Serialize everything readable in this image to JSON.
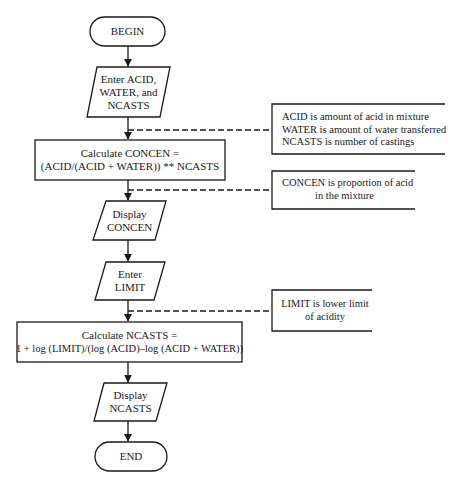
{
  "flowchart": {
    "nodes": [
      {
        "id": "begin",
        "type": "terminal",
        "lines": [
          "BEGIN"
        ]
      },
      {
        "id": "input1",
        "type": "io",
        "lines": [
          "Enter ACID,",
          "WATER, and",
          "NCASTS"
        ]
      },
      {
        "id": "calc1",
        "type": "process",
        "lines": [
          "Calculate CONCEN =",
          "(ACID/(ACID + WATER)) ** NCASTS"
        ]
      },
      {
        "id": "output1",
        "type": "io",
        "lines": [
          "Display",
          "CONCEN"
        ]
      },
      {
        "id": "input2",
        "type": "io",
        "lines": [
          "Enter",
          "LIMIT"
        ]
      },
      {
        "id": "calc2",
        "type": "process",
        "lines": [
          "Calculate NCASTS =",
          "1 + log (LIMIT)/(log (ACID)–log (ACID + WATER))"
        ]
      },
      {
        "id": "output2",
        "type": "io",
        "lines": [
          "Display",
          "NCASTS"
        ]
      },
      {
        "id": "end",
        "type": "terminal",
        "lines": [
          "END"
        ]
      }
    ],
    "annotations": [
      {
        "id": "note1",
        "lines": [
          "ACID is amount of acid in mixture",
          "WATER is amount of water transferred",
          "NCASTS is number of castings"
        ]
      },
      {
        "id": "note2",
        "lines": [
          "CONCEN is proportion of acid",
          "in the mixture"
        ]
      },
      {
        "id": "note3",
        "lines": [
          "LIMIT is lower limit",
          "of acidity"
        ]
      }
    ],
    "colors": {
      "line": "#1a1a1a",
      "background": "#ffffff"
    }
  }
}
